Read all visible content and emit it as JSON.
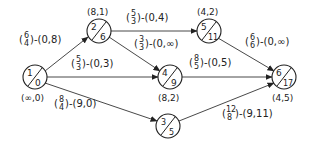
{
  "diagram": {
    "type": "network-flow-graph",
    "nodes": [
      {
        "id": "1",
        "top": "1",
        "bottom": "0",
        "label": "(∞,0)",
        "underline": "0",
        "cx": 35,
        "cy": 77
      },
      {
        "id": "2",
        "top": "2",
        "bottom": "6",
        "label": "(8,1)",
        "underline": "1",
        "cx": 99,
        "cy": 31
      },
      {
        "id": "5",
        "top": "5",
        "bottom": "11",
        "label": "(4,2)",
        "underline": "2",
        "cx": 209,
        "cy": 31
      },
      {
        "id": "4",
        "top": "4",
        "bottom": "9",
        "label": "(8,2)",
        "underline": "2",
        "cx": 170,
        "cy": 77
      },
      {
        "id": "3",
        "top": "3",
        "bottom": "5",
        "label": "",
        "underline": "",
        "cx": 168,
        "cy": 126
      },
      {
        "id": "6",
        "top": "6",
        "bottom": "17",
        "label": "(4,5)",
        "underline": "5",
        "cx": 284,
        "cy": 77
      }
    ],
    "edges": [
      {
        "from": "1",
        "to": "2",
        "num": "6",
        "den": "4",
        "pair": "-(0,8)"
      },
      {
        "from": "1",
        "to": "4",
        "num": "5",
        "den": "3",
        "pair": "-(0,3)"
      },
      {
        "from": "1",
        "to": "3",
        "num": "8",
        "den": "4",
        "pair": "-(9,0)"
      },
      {
        "from": "2",
        "to": "5",
        "num": "5",
        "den": "3",
        "pair": "-(0,4)"
      },
      {
        "from": "2",
        "to": "4",
        "num": "3",
        "den": "3",
        "pair": "-(0,∞)"
      },
      {
        "from": "5",
        "to": "6",
        "num": "6",
        "den": "6",
        "pair": "-(0,∞)"
      },
      {
        "from": "4",
        "to": "6",
        "num": "8",
        "den": "5",
        "pair": "-(0,5)"
      },
      {
        "from": "3",
        "to": "6",
        "num": "12",
        "den": "8",
        "pair": "-(9,11)"
      }
    ]
  }
}
